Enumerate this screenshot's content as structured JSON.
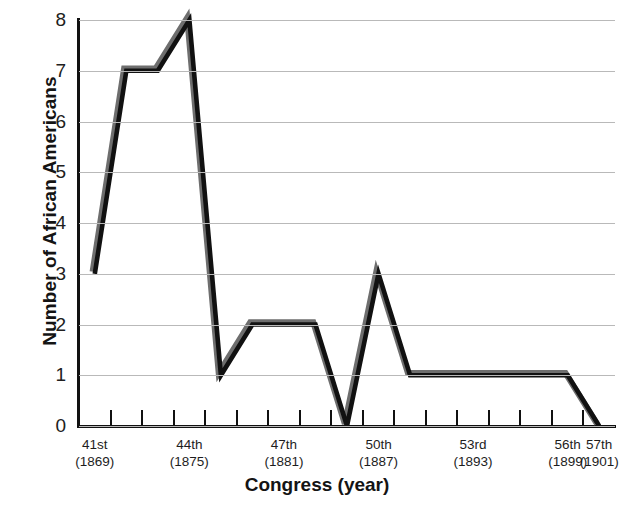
{
  "chart_data": {
    "type": "line",
    "title": "",
    "xlabel": "Congress (year)",
    "ylabel": "Number of African Americans",
    "ylim": [
      0,
      8
    ],
    "yticks": [
      0,
      1,
      2,
      3,
      4,
      5,
      6,
      7,
      8
    ],
    "grid": true,
    "legend": null,
    "x_tick_labels": [
      {
        "congress": "41st",
        "year": "(1869)"
      },
      {
        "congress": "44th",
        "year": "(1875)"
      },
      {
        "congress": "47th",
        "year": "(1881)"
      },
      {
        "congress": "50th",
        "year": "(1887)"
      },
      {
        "congress": "53rd",
        "year": "(1893)"
      },
      {
        "congress": "56th",
        "year": "(1899)"
      },
      {
        "congress": "57th",
        "year": "(1901)"
      }
    ],
    "categories": [
      "41st",
      "42nd",
      "43rd",
      "44th",
      "45th",
      "46th",
      "47th",
      "48th",
      "49th",
      "50th",
      "51st",
      "52nd",
      "53rd",
      "54th",
      "55th",
      "56th",
      "57th"
    ],
    "values": [
      3,
      7,
      7,
      8,
      1,
      2,
      2,
      2,
      0,
      3,
      1,
      1,
      1,
      1,
      1,
      1,
      0
    ],
    "series": [
      {
        "name": "African Americans in Congress",
        "values": [
          3,
          7,
          7,
          8,
          1,
          2,
          2,
          2,
          0,
          3,
          1,
          1,
          1,
          1,
          1,
          1,
          0
        ]
      }
    ],
    "line_color": "#111111",
    "line_shadow_color": "#6e6e6e",
    "grid_color": "#b9b9b9",
    "axis_color": "#111111",
    "background": "#ffffff"
  }
}
